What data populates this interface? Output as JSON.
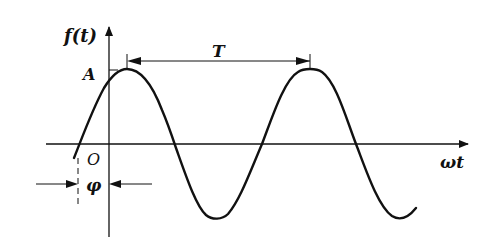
{
  "diagram": {
    "labels": {
      "y_axis": "f(t)",
      "x_axis": "ωt",
      "origin": "O",
      "amplitude": "A",
      "period": "T",
      "phase": "φ"
    },
    "colors": {
      "stroke": "#111111",
      "background": "#ffffff"
    }
  }
}
